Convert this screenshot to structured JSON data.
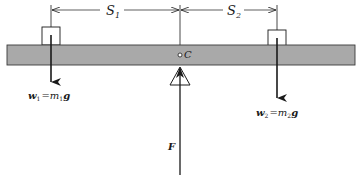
{
  "diagram": {
    "type": "lever-balance",
    "colors": {
      "beam_fill": "#a9a9a9",
      "line": "#1a1a1a",
      "background": "#ffffff"
    },
    "labels": {
      "s1": "S",
      "s1_sub": "1",
      "s2": "S",
      "s2_sub": "2",
      "pivot": "C",
      "w1_lhs": "w",
      "w1_sub": "1",
      "w1_eq": "=",
      "w1_m": "m",
      "w1_m_sub": "1",
      "w1_g": "g",
      "w2_lhs": "w",
      "w2_sub": "2",
      "w2_eq": "=",
      "w2_m": "m",
      "w2_m_sub": "2",
      "w2_g": "g",
      "force": "F"
    }
  }
}
